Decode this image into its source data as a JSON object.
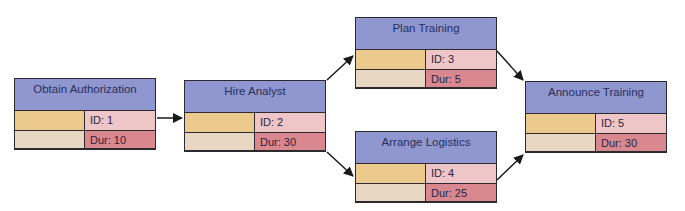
{
  "diagram": {
    "type": "network-diagram",
    "colors": {
      "header": "#9096d0",
      "cell_tan": "#ecca8e",
      "cell_beige": "#e8d8c3",
      "cell_pink": "#efc6c7",
      "cell_rose": "#d9888f",
      "border": "#2c2a2e"
    },
    "nodes": [
      {
        "name": "Obtain Authorization",
        "id": "ID: 1",
        "dur": "Dur: 10"
      },
      {
        "name": "Hire Analyst",
        "id": "ID: 2",
        "dur": "Dur: 30"
      },
      {
        "name": "Plan Training",
        "id": "ID: 3",
        "dur": "Dur: 5"
      },
      {
        "name": "Arrange Logistics",
        "id": "ID: 4",
        "dur": "Dur: 25"
      },
      {
        "name": "Announce Training",
        "id": "ID: 5",
        "dur": "Dur: 30"
      }
    ],
    "edges": [
      {
        "from": "1",
        "to": "2"
      },
      {
        "from": "2",
        "to": "3"
      },
      {
        "from": "2",
        "to": "4"
      },
      {
        "from": "3",
        "to": "5"
      },
      {
        "from": "4",
        "to": "5"
      }
    ]
  }
}
